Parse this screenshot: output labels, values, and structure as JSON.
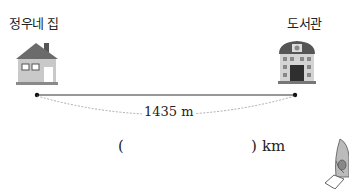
{
  "problem": {
    "start": {
      "label": "정우네 집",
      "icon": "house-icon"
    },
    "end": {
      "label": "도서관",
      "icon": "library-icon"
    },
    "distance": {
      "value": "1435",
      "unit": "m",
      "text": "1435 m"
    },
    "answer": {
      "open_paren": "(",
      "close_paren": ")",
      "unit": "km",
      "value": ""
    },
    "decoration": {
      "icon": "character-icon"
    }
  }
}
